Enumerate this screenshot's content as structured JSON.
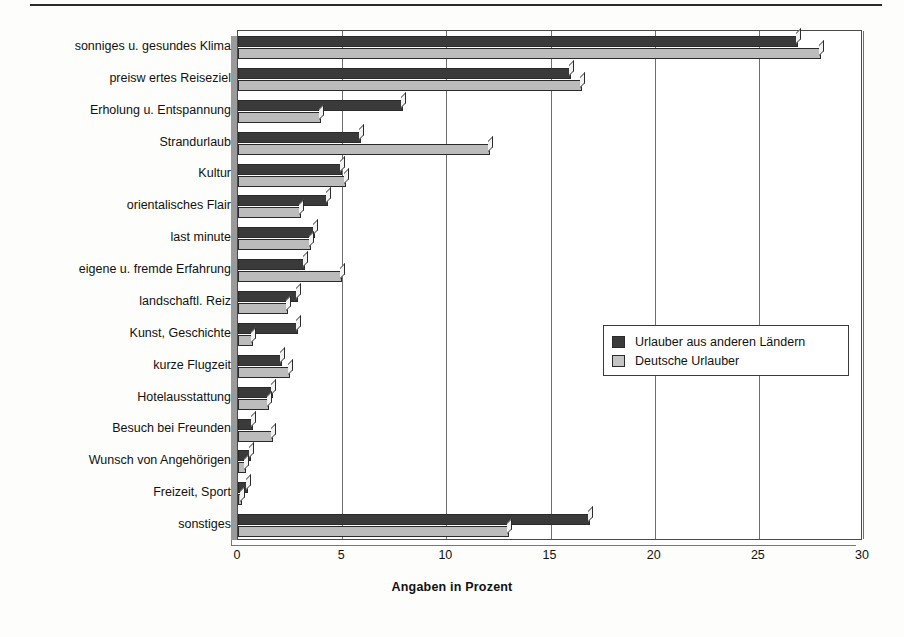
{
  "chart_data": {
    "type": "bar",
    "orientation": "horizontal",
    "title": "",
    "xlabel": "Angaben in Prozent",
    "ylabel": "",
    "xlim": [
      0,
      30
    ],
    "xticks": [
      0,
      5,
      10,
      15,
      20,
      25,
      30
    ],
    "grid": true,
    "legend_position": "middle-right",
    "categories": [
      "sonniges u. gesundes Klima",
      "preisw ertes Reiseziel",
      "Erholung u. Entspannung",
      "Strandurlaub",
      "Kultur",
      "orientalisches Flair",
      "last minute",
      "eigene u. fremde Erfahrung",
      "landschaftl. Reiz",
      "Kunst, Geschichte",
      "kurze Flugzeit",
      "Hotelausstattung",
      "Besuch bei Freunden",
      "Wunsch von Angehörigen",
      "Freizeit, Sport",
      "sonstiges"
    ],
    "series": [
      {
        "name": "Urlauber aus anderen Ländern",
        "color": "#3a3a3a",
        "values": [
          26.9,
          16.0,
          7.9,
          5.9,
          5.0,
          4.3,
          3.7,
          3.2,
          2.9,
          2.9,
          2.1,
          1.7,
          0.7,
          0.6,
          0.5,
          16.9
        ]
      },
      {
        "name": "Deutsche Urlauber",
        "color": "#bcbcbc",
        "values": [
          28.0,
          16.5,
          4.0,
          12.1,
          5.2,
          3.0,
          3.5,
          5.0,
          2.4,
          0.7,
          2.5,
          1.5,
          1.7,
          0.4,
          0.2,
          13.0
        ]
      }
    ]
  },
  "legend": {
    "entries": [
      {
        "label": "Urlauber aus anderen Ländern"
      },
      {
        "label": "Deutsche Urlauber"
      }
    ]
  }
}
